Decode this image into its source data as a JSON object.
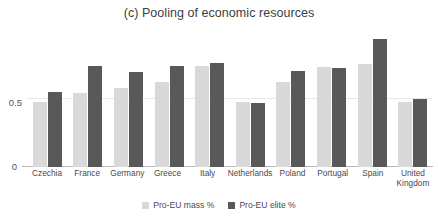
{
  "chart_data": {
    "type": "bar",
    "title": "(c) Pooling of economic resources",
    "xlabel": "",
    "ylabel": "",
    "ylim": [
      0,
      1.0
    ],
    "yticks": [
      "0",
      "0.5"
    ],
    "ytick_values": [
      0,
      0.5
    ],
    "grid": true,
    "legend_position": "bottom",
    "categories": [
      "Czechia",
      "France",
      "Germany",
      "Greece",
      "Italy",
      "Netherlands",
      "Poland",
      "Portugal",
      "Spain",
      "United Kingdom"
    ],
    "series": [
      {
        "name": "Pro-EU mass %",
        "color": "#d9d9d9",
        "values": [
          0.47,
          0.53,
          0.57,
          0.61,
          0.73,
          0.47,
          0.61,
          0.72,
          0.74,
          0.47
        ]
      },
      {
        "name": "Pro-EU elite %",
        "color": "#595959",
        "values": [
          0.54,
          0.73,
          0.68,
          0.73,
          0.75,
          0.46,
          0.69,
          0.71,
          0.92,
          0.49
        ]
      }
    ]
  },
  "axis": {
    "y_tick_zero": "0",
    "y_tick_half": "0.5"
  },
  "legend": {
    "items": [
      {
        "label": "Pro-EU mass %",
        "color": "#d9d9d9"
      },
      {
        "label": "Pro-EU elite %",
        "color": "#595959"
      }
    ]
  }
}
